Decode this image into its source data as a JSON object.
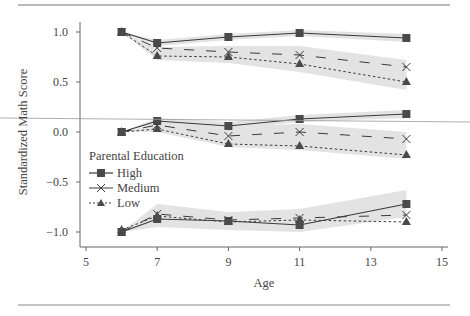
{
  "chart_data": {
    "type": "line",
    "title": "",
    "xlabel": "Age",
    "ylabel": "Standardized Math Score",
    "xlim": [
      5,
      15
    ],
    "ylim": [
      -1.1,
      1.1
    ],
    "x_ticks": [
      5,
      7,
      9,
      11,
      13,
      15
    ],
    "y_ticks": [
      1.0,
      0.5,
      0.0,
      -0.5,
      -1.0
    ],
    "x_tick_labels": [
      "5",
      "7",
      "9",
      "11",
      "13",
      "15"
    ],
    "y_tick_labels": [
      "1.0",
      "0.5",
      "0.0",
      "−0.5",
      "−1.0"
    ],
    "grid": false,
    "legend": {
      "title": "Parental Education",
      "position": "left-middle",
      "entries": [
        "High",
        "Medium",
        "Low"
      ]
    },
    "x": [
      6,
      7,
      9,
      11,
      14
    ],
    "groups": [
      {
        "name": "Start 1.0",
        "series": [
          {
            "name": "High",
            "marker": "square",
            "line": "solid",
            "values": [
              1.0,
              0.89,
              0.95,
              0.99,
              0.94
            ],
            "band": [
              [
                1.0,
                1.0
              ],
              [
                0.86,
                0.92
              ],
              [
                0.92,
                0.98
              ],
              [
                0.96,
                1.02
              ],
              [
                0.9,
                0.98
              ]
            ]
          },
          {
            "name": "Medium",
            "marker": "x",
            "line": "dashed",
            "values": [
              1.0,
              0.84,
              0.8,
              0.77,
              0.65
            ],
            "band": [
              [
                1.0,
                1.0
              ],
              [
                0.72,
                0.85
              ],
              [
                0.69,
                0.86
              ],
              [
                0.6,
                0.86
              ],
              [
                0.42,
                0.72
              ]
            ]
          },
          {
            "name": "Low",
            "marker": "triangle",
            "line": "dotted",
            "values": [
              1.0,
              0.76,
              0.75,
              0.68,
              0.5
            ],
            "band": [
              [
                1.0,
                1.0
              ],
              [
                0.72,
                0.85
              ],
              [
                0.69,
                0.86
              ],
              [
                0.6,
                0.86
              ],
              [
                0.42,
                0.72
              ]
            ]
          }
        ]
      },
      {
        "name": "Start 0.0",
        "series": [
          {
            "name": "High",
            "marker": "square",
            "line": "solid",
            "values": [
              0.0,
              0.11,
              0.06,
              0.13,
              0.18
            ],
            "band": [
              [
                0.0,
                0.0
              ],
              [
                0.08,
                0.14
              ],
              [
                0.03,
                0.1
              ],
              [
                0.1,
                0.17
              ],
              [
                0.14,
                0.22
              ]
            ]
          },
          {
            "name": "Medium",
            "marker": "x",
            "line": "dashed",
            "values": [
              0.0,
              0.07,
              -0.04,
              0.0,
              -0.07
            ],
            "band": [
              [
                0.0,
                0.0
              ],
              [
                0.0,
                0.08
              ],
              [
                -0.15,
                0.06
              ],
              [
                -0.18,
                0.08
              ],
              [
                -0.27,
                0.0
              ]
            ]
          },
          {
            "name": "Low",
            "marker": "triangle",
            "line": "dotted",
            "values": [
              0.0,
              0.03,
              -0.12,
              -0.14,
              -0.23
            ],
            "band": [
              [
                0.0,
                0.0
              ],
              [
                0.0,
                0.08
              ],
              [
                -0.15,
                0.06
              ],
              [
                -0.18,
                0.08
              ],
              [
                -0.27,
                0.0
              ]
            ]
          }
        ]
      },
      {
        "name": "Start -1.0",
        "series": [
          {
            "name": "High",
            "marker": "square",
            "line": "solid",
            "values": [
              -1.0,
              -0.87,
              -0.89,
              -0.93,
              -0.72
            ],
            "band": [
              [
                -1.0,
                -1.0
              ],
              [
                -0.95,
                -0.72
              ],
              [
                -0.98,
                -0.8
              ],
              [
                -1.0,
                -0.77
              ],
              [
                -0.85,
                -0.58
              ]
            ]
          },
          {
            "name": "Medium",
            "marker": "x",
            "line": "dashed",
            "values": [
              -1.0,
              -0.82,
              -0.88,
              -0.86,
              -0.83
            ],
            "band": [
              [
                -1.0,
                -1.0
              ],
              [
                -0.95,
                -0.72
              ],
              [
                -0.98,
                -0.8
              ],
              [
                -1.0,
                -0.77
              ],
              [
                -0.85,
                -0.58
              ]
            ]
          },
          {
            "name": "Low",
            "marker": "triangle",
            "line": "dotted",
            "values": [
              -0.98,
              -0.84,
              -0.9,
              -0.88,
              -0.9
            ],
            "band": [
              [
                -1.0,
                -1.0
              ],
              [
                -0.95,
                -0.72
              ],
              [
                -0.98,
                -0.8
              ],
              [
                -1.0,
                -0.77
              ],
              [
                -0.85,
                -0.58
              ]
            ]
          }
        ]
      }
    ]
  },
  "colors": {
    "line": "#3a3a3a",
    "marker": "#4a4a4a",
    "band": "#e3e3e3",
    "axis": "#555555",
    "rule": "#777777",
    "text": "#444444"
  }
}
